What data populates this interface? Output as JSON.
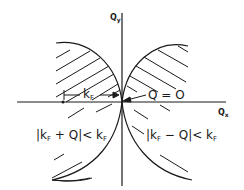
{
  "diagram": {
    "colors": {
      "ink": "#1a1a1a",
      "background": "#ffffff"
    },
    "axes": {
      "x": {
        "label": "Q",
        "subscript": "x"
      },
      "y": {
        "label": "Q",
        "subscript": "y"
      }
    },
    "annotations": {
      "kf_length": {
        "main": "k",
        "sub": "F"
      },
      "origin": {
        "text": "Q = O"
      },
      "left_region": {
        "part1": "|k",
        "sub1": "F",
        "part2": " + Q|< k",
        "sub2": "F"
      },
      "right_region": {
        "part1": "|k",
        "sub1": "F",
        "part2": " − Q|< k",
        "sub2": "F"
      }
    },
    "regions": [
      {
        "name": "left-circle-region",
        "center_x": "-kF",
        "radius": "kF",
        "hatched": "upper-half"
      },
      {
        "name": "right-circle-region",
        "center_x": "+kF",
        "radius": "kF",
        "hatched": "upper-half"
      }
    ]
  }
}
